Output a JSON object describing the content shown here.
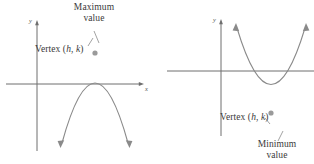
{
  "figure": {
    "panels": [
      {
        "id": "maximum-parabola",
        "direction": "opens-down",
        "axis_x_label": "x",
        "axis_y_label": "y",
        "callout_title_line1": "Maximum",
        "callout_title_line2": "value",
        "vertex_label_prefix": "Vertex (",
        "vertex_label_h": "h",
        "vertex_label_sep": ", ",
        "vertex_label_k": "k",
        "vertex_label_suffix": ")"
      },
      {
        "id": "minimum-parabola",
        "direction": "opens-up",
        "axis_x_label": "x",
        "axis_y_label": "y",
        "callout_title_line1": "Minimum",
        "callout_title_line2": "value",
        "vertex_label_prefix": "Vertex (",
        "vertex_label_h": "h",
        "vertex_label_sep": ", ",
        "vertex_label_k": "k",
        "vertex_label_suffix": ")"
      }
    ],
    "colors": {
      "curve": "#8a8a8a",
      "axis": "#6e6e6e",
      "text": "#3a3a3a",
      "vertex_dot": "#9a9a9a",
      "leader": "#8a8a8a"
    }
  }
}
